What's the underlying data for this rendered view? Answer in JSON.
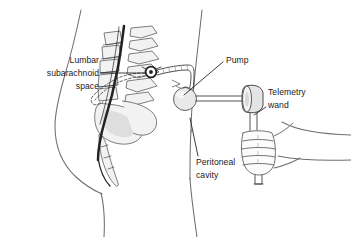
{
  "figure": {
    "background_color": "#ffffff",
    "width": 351,
    "height": 237,
    "line_color": "#4a4a4e",
    "outline_color": "#6f6f72",
    "bone_fill": "#f2f2f2",
    "bone_shade": "#dedede",
    "text_color": "#1a1a1a",
    "canal_color": "#232326"
  },
  "labels": {
    "lumbar": {
      "name": "lumbar-subarachnoid-space-label",
      "lines": [
        "Lumbar",
        "subarachnoid",
        "space"
      ],
      "align": "right",
      "anchor_x": 99,
      "line_y": [
        63,
        73,
        83
      ],
      "leader": "M101,73 L150,73"
    },
    "pump": {
      "name": "pump-label",
      "lines": [
        "Pump"
      ],
      "align": "left",
      "anchor_x": 226,
      "line_y": [
        60
      ],
      "leader": "M223,62 L182,96"
    },
    "telemetry": {
      "name": "telemetry-wand-label",
      "lines": [
        "Telemetry",
        "wand"
      ],
      "align": "left",
      "anchor_x": 268,
      "line_y": [
        93,
        103
      ],
      "leader": "M266,106 L252,114"
    },
    "peritoneal": {
      "name": "peritoneal-cavity-label",
      "lines": [
        "Peritoneal",
        "cavity"
      ],
      "align": "left",
      "anchor_x": 196,
      "line_y": [
        163,
        173
      ],
      "leader": "M199,157 L192,120"
    }
  },
  "anatomy": {
    "back_contour": "back-body-contour",
    "abdomen_contour": "abdomen-contour",
    "arm_contour": "arm-contour",
    "vertebra_count": 5,
    "sacrum": "sacrum",
    "coccyx": "coccyx",
    "spinal_canal": "spinal-canal"
  },
  "devices": {
    "catheter": "intrathecal-catheter",
    "anchor": "catheter-anchor-marker",
    "pump": "implanted-pump",
    "wand": "telemetry-wand",
    "hand": "clinician-hand"
  }
}
